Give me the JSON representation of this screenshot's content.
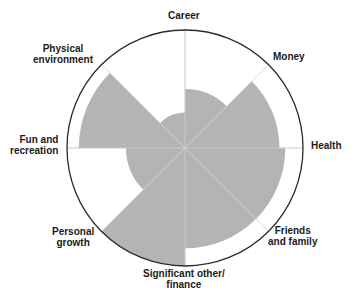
{
  "chart_data": {
    "type": "polar-area",
    "title": "",
    "scale_max": 10,
    "spoke_labels": [
      "Career",
      "Money",
      "Health",
      "Friends and family",
      "Significant other/ finance",
      "Personal growth",
      "Fun and recreation",
      "Physical environment"
    ],
    "sectors": [
      {
        "from": "Career",
        "to": "Money",
        "start_deg": 0,
        "end_deg": 45,
        "value": 5
      },
      {
        "from": "Money",
        "to": "Health",
        "start_deg": 45,
        "end_deg": 90,
        "value": 8
      },
      {
        "from": "Health",
        "to": "Friends and family",
        "start_deg": 90,
        "end_deg": 135,
        "value": 8.5
      },
      {
        "from": "Friends and family",
        "to": "Significant other/ finance",
        "start_deg": 135,
        "end_deg": 180,
        "value": 8.5
      },
      {
        "from": "Significant other/ finance",
        "to": "Personal growth",
        "start_deg": 180,
        "end_deg": 225,
        "value": 10
      },
      {
        "from": "Personal growth",
        "to": "Fun and recreation",
        "start_deg": 225,
        "end_deg": 270,
        "value": 5
      },
      {
        "from": "Fun and recreation",
        "to": "Physical environment",
        "start_deg": 270,
        "end_deg": 315,
        "value": 9
      },
      {
        "from": "Physical environment",
        "to": "Career",
        "start_deg": 315,
        "end_deg": 360,
        "value": 3
      }
    ],
    "colors": {
      "fill": "#b4b4b4",
      "outline": "#2a2a2a",
      "spoke": "#d0d0d0"
    }
  },
  "labels": {
    "career": "Career",
    "money": "Money",
    "health": "Health",
    "friends_1": "Friends",
    "friends_2": "and family",
    "significant_1": "Significant other/",
    "significant_2": "finance",
    "personal_1": "Personal",
    "personal_2": "growth",
    "fun_1": "Fun and",
    "fun_2": "recreation",
    "physical_1": "Physical",
    "physical_2": "environment"
  }
}
